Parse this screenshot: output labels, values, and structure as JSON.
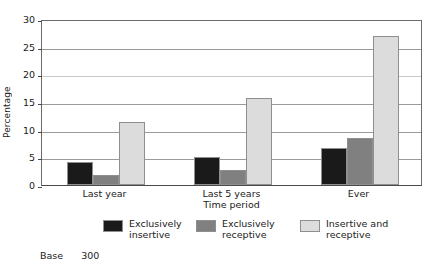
{
  "chart_data": {
    "type": "bar",
    "title": "",
    "xlabel": "Time period",
    "ylabel": "Percentage",
    "categories": [
      "Last year",
      "Last 5 years",
      "Ever"
    ],
    "series": [
      {
        "name": "Exclusively insertive",
        "color": "#1a1a1a",
        "values": [
          4.2,
          5.1,
          6.6
        ]
      },
      {
        "name": "Exclusively receptive",
        "color": "#808080",
        "values": [
          1.9,
          2.7,
          8.5
        ]
      },
      {
        "name": "Insertive and receptive",
        "color": "#dcdcdc",
        "values": [
          11.3,
          15.8,
          27.0
        ]
      }
    ],
    "ylim": [
      0,
      30
    ],
    "yticks": [
      0,
      5,
      10,
      15,
      20,
      25,
      30
    ],
    "ytick_labels": [
      "0",
      "5",
      "10",
      "15",
      "20",
      "25",
      "30"
    ],
    "grid": true,
    "legend_position": "below"
  },
  "legend": {
    "items": [
      {
        "label": "Exclusively\ninsertive",
        "color": "#1a1a1a"
      },
      {
        "label": "Exclusively\nreceptive",
        "color": "#808080"
      },
      {
        "label": "Insertive and\nreceptive",
        "color": "#dcdcdc"
      }
    ]
  },
  "footnote": {
    "label": "Base",
    "value": "300"
  }
}
